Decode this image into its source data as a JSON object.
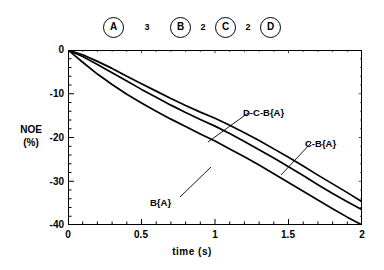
{
  "spin_system": {
    "name": "spin-system-diagram",
    "nodes": [
      "A",
      "B",
      "C",
      "D"
    ],
    "distances": [
      "3",
      "2",
      "2"
    ]
  },
  "chart_data": {
    "type": "line",
    "title": "",
    "xlabel": "time  (s)",
    "ylabel": "NOE\n(%)",
    "ylabel_line1": "NOE",
    "ylabel_line2": "(%)",
    "xlim": [
      0,
      2
    ],
    "ylim": [
      -40,
      0
    ],
    "xticks": [
      "0",
      "0.5",
      "1",
      "1.5",
      "2"
    ],
    "xtick_values": [
      0,
      0.5,
      1,
      1.5,
      2
    ],
    "yticks": [
      "0",
      "-10",
      "-20",
      "-30",
      "-40"
    ],
    "ytick_values": [
      0,
      -10,
      -20,
      -30,
      -40
    ],
    "grid": false,
    "legend": "inline-annotations",
    "x": [
      0,
      0.1,
      0.2,
      0.3,
      0.4,
      0.5,
      0.6,
      0.7,
      0.8,
      0.9,
      1.0,
      1.1,
      1.2,
      1.3,
      1.4,
      1.5,
      1.6,
      1.7,
      1.8,
      1.9,
      2.0
    ],
    "series": [
      {
        "name": "D-C-B{A}",
        "label": "D-C-B{A}",
        "color": "#000000",
        "values": [
          0,
          -1.1,
          -2.6,
          -4.2,
          -6.0,
          -7.7,
          -9.4,
          -11.1,
          -12.7,
          -14.2,
          -15.6,
          -17.2,
          -18.9,
          -20.7,
          -22.6,
          -24.5,
          -26.5,
          -28.6,
          -30.6,
          -32.6,
          -34.7
        ]
      },
      {
        "name": "C-B{A}",
        "label": "C-B{A}",
        "color": "#000000",
        "values": [
          0,
          -1.5,
          -3.3,
          -5.2,
          -7.1,
          -9.0,
          -10.8,
          -12.6,
          -14.3,
          -15.9,
          -17.4,
          -19.1,
          -20.9,
          -22.8,
          -24.7,
          -26.7,
          -28.7,
          -30.8,
          -32.8,
          -34.7,
          -36.5
        ]
      },
      {
        "name": "B{A}",
        "label": "B{A}",
        "color": "#000000",
        "values": [
          0,
          -2.8,
          -5.5,
          -7.9,
          -10.1,
          -12.1,
          -14.0,
          -15.8,
          -17.5,
          -19.2,
          -20.8,
          -22.6,
          -24.4,
          -26.3,
          -28.3,
          -30.3,
          -32.3,
          -34.3,
          -36.3,
          -38.2,
          -40.0
        ]
      }
    ],
    "annotations": [
      {
        "text": "D-C-B{A}",
        "series": "D-C-B{A}"
      },
      {
        "text": "C-B{A}",
        "series": "C-B{A}"
      },
      {
        "text": "B{A}",
        "series": "B{A}"
      }
    ]
  }
}
